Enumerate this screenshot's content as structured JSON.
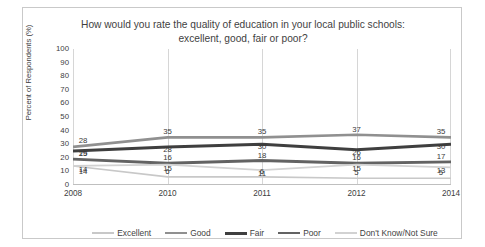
{
  "chart_data": {
    "type": "line",
    "title": "How would you rate the quality of education in your local public schools: excellent, good, fair or poor?",
    "xlabel": "",
    "ylabel": "Percent of Respondents (%)",
    "categories": [
      "2008",
      "2010",
      "2011",
      "2012",
      "2014"
    ],
    "ylim": [
      0,
      100
    ],
    "yticks": [
      100,
      90,
      80,
      70,
      60,
      50,
      40,
      30,
      20,
      10,
      0
    ],
    "grid": false,
    "legend_position": "bottom",
    "series": [
      {
        "name": "Excellent",
        "values": [
          14,
          6,
          6,
          5,
          5
        ],
        "color": "#c8c8c8"
      },
      {
        "name": "Good",
        "values": [
          28,
          35,
          35,
          37,
          35
        ],
        "color": "#909090"
      },
      {
        "name": "Fair",
        "values": [
          25,
          28,
          30,
          26,
          30
        ],
        "color": "#3f3f3f"
      },
      {
        "name": "Poor",
        "values": [
          19,
          16,
          18,
          16,
          17
        ],
        "color": "#636363"
      },
      {
        "name": "Don't Know/Not Sure",
        "values": [
          14,
          15,
          11,
          15,
          13
        ],
        "color": "#d2d2d2"
      }
    ]
  },
  "legend": {
    "items": [
      {
        "label": "Excellent"
      },
      {
        "label": "Good"
      },
      {
        "label": "Fair"
      },
      {
        "label": "Poor"
      },
      {
        "label": "Don't Know/Not Sure"
      }
    ]
  }
}
